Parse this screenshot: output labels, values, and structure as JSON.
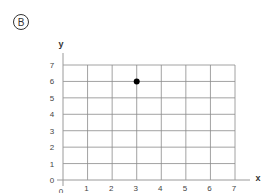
{
  "panel": {
    "badge_label": "B"
  },
  "colors": {
    "grid": "#8a8a8a",
    "axis": "#9a9a9a",
    "point": "#000000",
    "text": "#444444"
  },
  "chart_data": {
    "type": "scatter",
    "title": "",
    "xlabel": "x",
    "ylabel": "y",
    "xlim": [
      0,
      7
    ],
    "ylim": [
      0,
      7
    ],
    "grid": true,
    "x_ticks": [
      "0",
      "1",
      "2",
      "3",
      "4",
      "5",
      "6",
      "7"
    ],
    "y_ticks": [
      "0",
      "1",
      "2",
      "3",
      "4",
      "5",
      "6",
      "7"
    ],
    "series": [
      {
        "name": "point",
        "points": [
          {
            "x": 3,
            "y": 6
          }
        ]
      }
    ]
  }
}
